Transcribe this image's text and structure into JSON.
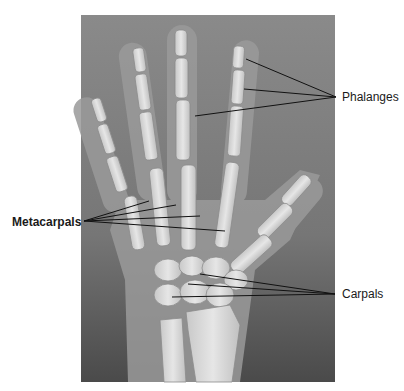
{
  "figure": {
    "image": {
      "x": 81,
      "y": 15,
      "width": 254,
      "height": 367,
      "background": "#7d7d7d"
    },
    "labels": [
      {
        "id": "phalanges",
        "text": "Phalanges",
        "x": 342,
        "y": 90,
        "bold": false,
        "anchor": [
          336,
          97
        ],
        "targets": [
          [
            246,
            59
          ],
          [
            244,
            89
          ],
          [
            195,
            116
          ]
        ]
      },
      {
        "id": "metacarpals",
        "text": "Metacarpals",
        "x": 12,
        "y": 215,
        "bold": true,
        "anchor": [
          84,
          221
        ],
        "targets": [
          [
            149,
            201
          ],
          [
            176,
            205
          ],
          [
            200,
            216
          ],
          [
            225,
            231
          ]
        ]
      },
      {
        "id": "carpals",
        "text": "Carpals",
        "x": 342,
        "y": 287,
        "bold": false,
        "anchor": [
          335,
          294
        ],
        "targets": [
          [
            200,
            274
          ],
          [
            188,
            284
          ],
          [
            172,
            297
          ]
        ]
      }
    ]
  }
}
